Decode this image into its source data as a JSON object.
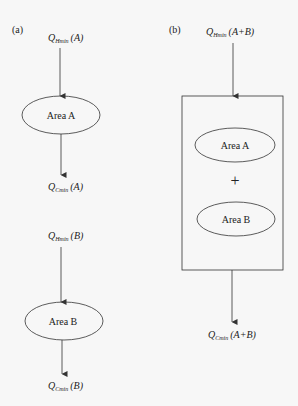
{
  "panel_a": {
    "label": "(a)",
    "top": {
      "q_in": {
        "symbol": "Q",
        "sub": "Hmin",
        "arg": "(A)"
      },
      "node": "Area A",
      "q_out": {
        "symbol": "Q",
        "sub": "Cmin",
        "arg": "(A)"
      }
    },
    "bottom": {
      "q_in": {
        "symbol": "Q",
        "sub": "Hmin",
        "arg": "(B)"
      },
      "node": "Area B",
      "q_out": {
        "symbol": "Q",
        "sub": "Cmin",
        "arg": "(B)"
      }
    }
  },
  "panel_b": {
    "label": "(b)",
    "q_in": {
      "symbol": "Q",
      "sub": "Hmin",
      "arg": "(A+B)"
    },
    "node_1": "Area A",
    "operator": "+",
    "node_2": "Area B",
    "q_out": {
      "symbol": "Q",
      "sub": "Cmin",
      "arg": "(A+B)"
    }
  },
  "colors": {
    "stroke": "#333333",
    "text": "#222222",
    "background": "#f7f7f7"
  }
}
